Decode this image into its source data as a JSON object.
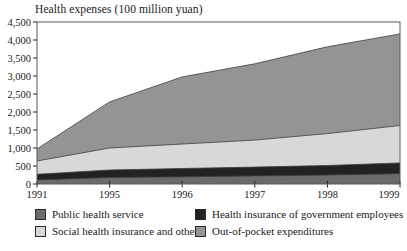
{
  "title": "Health expenses (100 million yuan)",
  "chart_data": {
    "type": "area",
    "stacked": true,
    "title": "Health expenses (100 million yuan)",
    "xlabel": "",
    "ylabel": "100 million yuan",
    "categories": [
      "1991",
      "1995",
      "1996",
      "1997",
      "1998",
      "1999"
    ],
    "series": [
      {
        "name": "Public health service",
        "color": "#6b6b6b",
        "values": [
          110,
          180,
          200,
          225,
          250,
          285
        ]
      },
      {
        "name": "Health insurance of government employees",
        "color": "#222222",
        "values": [
          160,
          210,
          230,
          245,
          265,
          300
        ]
      },
      {
        "name": "Social health insurance and others",
        "color": "#d8d8d8",
        "values": [
          370,
          610,
          680,
          750,
          885,
          1040
        ]
      },
      {
        "name": "Out-of-pocket expenditures",
        "color": "#949494",
        "values": [
          335,
          1280,
          1865,
          2120,
          2410,
          2545
        ]
      }
    ],
    "totals": [
      975,
      2280,
      2975,
      3340,
      3810,
      4170
    ],
    "ylim": [
      0,
      4500
    ],
    "ytick_step": 500,
    "yticks": [
      "0",
      "500",
      "1,000",
      "1,500",
      "2,000",
      "2,500",
      "3,000",
      "3,500",
      "4,000",
      "4,500"
    ],
    "grid": false,
    "legend_position": "bottom",
    "frame_color": "#5a5a5a",
    "boundary_line_color": "#3d3d3d",
    "tick_color": "#222222"
  }
}
